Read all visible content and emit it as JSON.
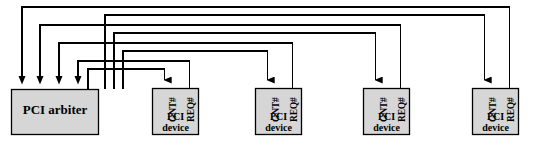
{
  "diagram": {
    "colors": {
      "box_fill": "#d6d6d6",
      "box_stroke": "#000000",
      "line_stroke": "#000000",
      "background": "#ffffff"
    },
    "arbiter": {
      "label": "PCI arbiter",
      "x": 11,
      "y": 89,
      "w": 88,
      "h": 46
    },
    "devices": [
      {
        "id": "device-1",
        "line1": "PCI",
        "line2": "device",
        "gnt_label": "GNT#",
        "req_label": "REQ#",
        "x": 152,
        "y": 88,
        "w": 47,
        "h": 47
      },
      {
        "id": "device-2",
        "line1": "PCI",
        "line2": "device",
        "gnt_label": "GNT#",
        "req_label": "REQ#",
        "x": 255,
        "y": 88,
        "w": 47,
        "h": 47
      },
      {
        "id": "device-3",
        "line1": "PCI",
        "line2": "device",
        "gnt_label": "GNT#",
        "req_label": "REQ#",
        "x": 363,
        "y": 88,
        "w": 47,
        "h": 47
      },
      {
        "id": "device-4",
        "line1": "PCI",
        "line2": "device",
        "gnt_label": "GNT#",
        "req_label": "REQ#",
        "x": 472,
        "y": 88,
        "w": 47,
        "h": 47
      }
    ],
    "signals": [
      {
        "name": "gnt-1",
        "from": "arbiter",
        "to": "device-1",
        "direction": "arbiter-to-device"
      },
      {
        "name": "req-1",
        "from": "device-1",
        "to": "arbiter",
        "direction": "device-to-arbiter"
      },
      {
        "name": "gnt-2",
        "from": "arbiter",
        "to": "device-2",
        "direction": "arbiter-to-device"
      },
      {
        "name": "req-2",
        "from": "device-2",
        "to": "arbiter",
        "direction": "device-to-arbiter"
      },
      {
        "name": "gnt-3",
        "from": "arbiter",
        "to": "device-3",
        "direction": "arbiter-to-device"
      },
      {
        "name": "req-3",
        "from": "device-3",
        "to": "arbiter",
        "direction": "device-to-arbiter"
      },
      {
        "name": "gnt-4",
        "from": "arbiter",
        "to": "device-4",
        "direction": "arbiter-to-device"
      },
      {
        "name": "req-4",
        "from": "device-4",
        "to": "arbiter",
        "direction": "device-to-arbiter"
      }
    ]
  }
}
